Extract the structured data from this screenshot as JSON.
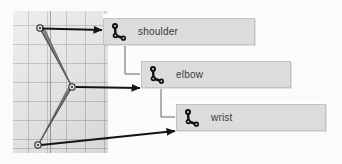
{
  "viewport": {
    "name": "skeleton-viewport",
    "grid_color": "#96969b",
    "background_color": "#e5e5e5",
    "axis_color": "#8d8d92",
    "rig_color": "#4a4a4a"
  },
  "callouts": [
    {
      "id": "shoulder",
      "label": "shoulder",
      "icon": "joint-bone-icon",
      "box_color": "#dcdcdc",
      "border_color": "#c2c2c2",
      "text_color": "#3a3a3a"
    },
    {
      "id": "elbow",
      "label": "elbow",
      "icon": "joint-bone-icon",
      "box_color": "#dcdcdc",
      "border_color": "#c2c2c2",
      "text_color": "#3a3a3a"
    },
    {
      "id": "wrist",
      "label": "wrist",
      "icon": "joint-bone-icon",
      "box_color": "#dcdcdc",
      "border_color": "#c2c2c2",
      "text_color": "#3a3a3a"
    }
  ],
  "annotations": {
    "arrow_color": "#1a1a1a",
    "connector_color": "#555555",
    "arrow_count": 3
  },
  "joints": [
    {
      "name": "shoulder",
      "x": 40,
      "y": 28
    },
    {
      "name": "elbow",
      "x": 72,
      "y": 87
    },
    {
      "name": "wrist",
      "x": 38,
      "y": 145
    }
  ]
}
